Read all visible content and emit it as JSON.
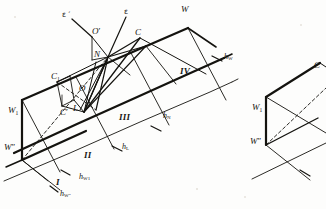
{
  "figure": {
    "background_color": "#fdfdfc",
    "ink_color": "#14130f",
    "points": {
      "W": "W",
      "W1": "W",
      "W1_sub": "1",
      "Wdp": "W",
      "Wdp_prime": "″",
      "C": "C",
      "C1": "C",
      "C1_sub": "1",
      "Cprime": "C",
      "Cprime_mark": "′",
      "O": "O",
      "Oprime": "O",
      "Oprime_mark": "′",
      "N": "N",
      "L": "L"
    },
    "axes": {
      "epsilon": "ε",
      "epsilon_prime": "ε ′"
    },
    "bands": [
      "I",
      "II",
      "III",
      "IV"
    ],
    "heights": {
      "hW": {
        "base": "h",
        "sub": "W"
      },
      "hN": {
        "base": "h",
        "sub": "N"
      },
      "hL": {
        "base": "h",
        "sub": "L"
      },
      "hW1": {
        "base": "h",
        "sub": "W1"
      },
      "hWdp": {
        "base": "h",
        "sub": "W″"
      }
    },
    "right_figure": {
      "W1": "W",
      "W1_sub": "1",
      "Wdp": "W",
      "Wdp_prime": "″",
      "C": "C"
    }
  }
}
